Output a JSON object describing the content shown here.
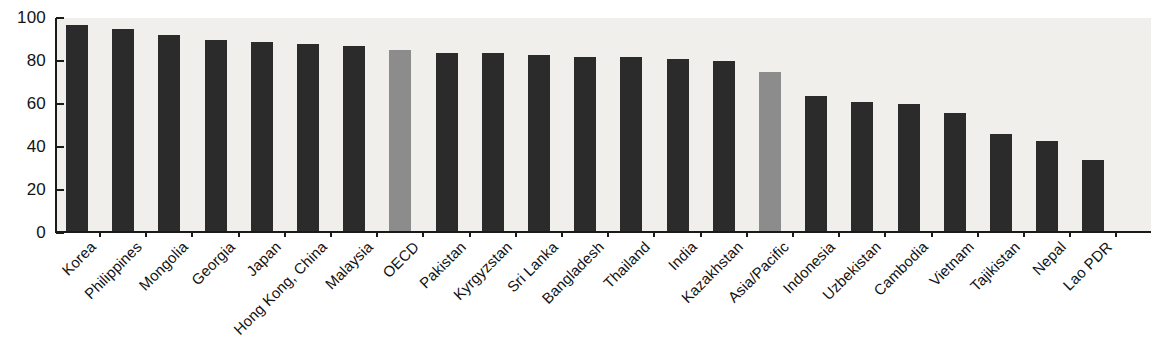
{
  "chart_data": {
    "type": "bar",
    "title": "",
    "subtitle": "",
    "xlabel": "",
    "ylabel": "",
    "ylim": [
      0,
      100
    ],
    "yticks": [
      0,
      20,
      40,
      60,
      80,
      100
    ],
    "ytick_labels": [
      "0",
      "20",
      "40",
      "60",
      "80",
      "100"
    ],
    "grid": false,
    "legend": "none",
    "categories": [
      "Korea",
      "Philippines",
      "Mongolia",
      "Georgia",
      "Japan",
      "Hong Kong, China",
      "Malaysia",
      "OECD",
      "Pakistan",
      "Kyrgyzstan",
      "Sri Lanka",
      "Bangladesh",
      "Thailand",
      "India",
      "Kazakhstan",
      "Asia/Pacific",
      "Indonesia",
      "Uzbekistan",
      "Cambodia",
      "Vietnam",
      "Tajikistan",
      "Nepal",
      "Lao PDR"
    ],
    "values": [
      96,
      94,
      91,
      89,
      88,
      87,
      86,
      84,
      83,
      83,
      82,
      81,
      81,
      80,
      79,
      74,
      63,
      60,
      59,
      55,
      45,
      42,
      33
    ],
    "series_kinds": [
      "main",
      "main",
      "main",
      "main",
      "main",
      "main",
      "main",
      "accent",
      "main",
      "main",
      "main",
      "main",
      "main",
      "main",
      "main",
      "accent",
      "main",
      "main",
      "main",
      "main",
      "main",
      "main",
      "main"
    ],
    "colors": {
      "main": "#2b2b2b",
      "accent": "#8c8c8c",
      "axis": "#1a1a1a",
      "plot_background": "#f1efec",
      "text": "#141414"
    }
  }
}
